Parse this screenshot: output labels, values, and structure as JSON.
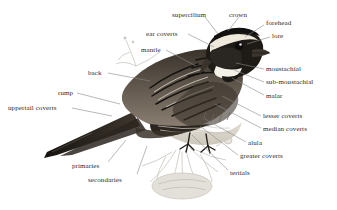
{
  "figure": {
    "kind": "bird-anatomy-diagram",
    "background_color": "#ffffff",
    "label_color": "#2b2b2b",
    "leader_line_color": "#8a8a8a",
    "plumage_colors": {
      "dark": "#1d1b19",
      "mid_brown": "#55four",
      "brown": "#6b5a48",
      "pale": "#d8d2c6",
      "white": "#f6f4ef",
      "sketch_gray": "#b9b6ae"
    }
  },
  "labels": [
    {
      "id": "supercilium",
      "text": "supercilium",
      "x": 172,
      "y": 12,
      "align": "left",
      "line": [
        [
          205,
          17
        ],
        [
          218,
          34
        ]
      ]
    },
    {
      "id": "crown",
      "text": "crown",
      "x": 229,
      "y": 12,
      "align": "left",
      "line": [
        [
          239,
          17
        ],
        [
          228,
          31
        ]
      ]
    },
    {
      "id": "forehead",
      "text": "forehead",
      "x": 266,
      "y": 20,
      "align": "left",
      "line": [
        [
          264,
          25
        ],
        [
          245,
          37
        ]
      ]
    },
    {
      "id": "lore",
      "text": "lore",
      "x": 272,
      "y": 33,
      "align": "left",
      "line": [
        [
          270,
          37
        ],
        [
          247,
          44
        ]
      ]
    },
    {
      "id": "ear-coverts",
      "text": "ear coverts",
      "x": 146,
      "y": 31,
      "align": "left",
      "line": [
        [
          188,
          34
        ],
        [
          214,
          47
        ]
      ]
    },
    {
      "id": "mantle",
      "text": "mantle",
      "x": 141,
      "y": 47,
      "align": "left",
      "line": [
        [
          166,
          50
        ],
        [
          196,
          66
        ]
      ]
    },
    {
      "id": "back",
      "text": "back",
      "x": 88,
      "y": 70,
      "align": "left",
      "line": [
        [
          108,
          73
        ],
        [
          150,
          81
        ]
      ]
    },
    {
      "id": "rump",
      "text": "rump",
      "x": 58,
      "y": 90,
      "align": "left",
      "line": [
        [
          77,
          93
        ],
        [
          120,
          104
        ]
      ]
    },
    {
      "id": "uppertail-coverts",
      "text": "uppertail coverts",
      "x": 8,
      "y": 105,
      "align": "left",
      "line": [
        [
          72,
          108
        ],
        [
          112,
          116
        ]
      ]
    },
    {
      "id": "primaries",
      "text": "primaries",
      "x": 72,
      "y": 163,
      "align": "left",
      "line": [
        [
          108,
          162
        ],
        [
          126,
          140
        ]
      ]
    },
    {
      "id": "secondaries",
      "text": "secondaries",
      "x": 88,
      "y": 177,
      "align": "left",
      "line": [
        [
          137,
          174
        ],
        [
          147,
          146
        ]
      ]
    },
    {
      "id": "moustachial",
      "text": "moustachial",
      "x": 266,
      "y": 66,
      "align": "left",
      "line": [
        [
          264,
          69
        ],
        [
          236,
          63
        ]
      ]
    },
    {
      "id": "sub-moustachial",
      "text": "sub-moustachial",
      "x": 266,
      "y": 79,
      "align": "left",
      "line": [
        [
          264,
          82
        ],
        [
          234,
          70
        ]
      ]
    },
    {
      "id": "malar",
      "text": "malar",
      "x": 266,
      "y": 93,
      "align": "left",
      "line": [
        [
          264,
          95
        ],
        [
          232,
          78
        ]
      ]
    },
    {
      "id": "lesser-coverts",
      "text": "lesser coverts",
      "x": 263,
      "y": 113,
      "align": "left",
      "line": [
        [
          261,
          116
        ],
        [
          222,
          96
        ]
      ]
    },
    {
      "id": "median-coverts",
      "text": "median coverts",
      "x": 263,
      "y": 126,
      "align": "left",
      "line": [
        [
          261,
          128
        ],
        [
          215,
          104
        ]
      ]
    },
    {
      "id": "alula",
      "text": "alula",
      "x": 248,
      "y": 140,
      "align": "left",
      "line": [
        [
          246,
          142
        ],
        [
          205,
          119
        ]
      ]
    },
    {
      "id": "greater-coverts",
      "text": "greater coverts",
      "x": 240,
      "y": 153,
      "align": "left",
      "line": [
        [
          238,
          155
        ],
        [
          200,
          126
        ]
      ]
    },
    {
      "id": "tertials",
      "text": "tertials",
      "x": 230,
      "y": 170,
      "align": "left",
      "line": [
        [
          228,
          170
        ],
        [
          192,
          135
        ]
      ]
    }
  ]
}
